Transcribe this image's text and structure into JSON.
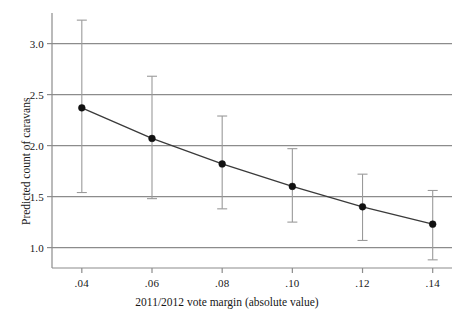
{
  "chart_data": {
    "type": "line",
    "title": "",
    "subtitle": "",
    "xlabel": "2011/2012 vote margin (absolute value)",
    "ylabel": "Predicted count of caravans",
    "x": [
      0.04,
      0.06,
      0.08,
      0.1,
      0.12,
      0.14
    ],
    "values": [
      2.37,
      2.07,
      1.82,
      1.6,
      1.4,
      1.23
    ],
    "error_low": [
      1.54,
      1.48,
      1.38,
      1.25,
      1.07,
      0.88
    ],
    "error_high": [
      3.23,
      2.68,
      2.29,
      1.97,
      1.72,
      1.56
    ],
    "series": [
      {
        "name": "Predicted count of caravans",
        "values": [
          2.37,
          2.07,
          1.82,
          1.6,
          1.4,
          1.23
        ]
      }
    ],
    "xlim": [
      0.0315,
      0.1455
    ],
    "ylim": [
      0.8,
      3.3
    ],
    "xticks": [
      0.04,
      0.06,
      0.08,
      0.1,
      0.12,
      0.14
    ],
    "xtick_labels": [
      ".04",
      ".06",
      ".08",
      ".10",
      ".12",
      ".14"
    ],
    "yticks": [
      1.0,
      1.5,
      2.0,
      2.5,
      3.0
    ],
    "ytick_labels": [
      "1.0",
      "1.5",
      "2.0",
      "2.5",
      "3.0"
    ],
    "grid": "horizontal",
    "legend": "none",
    "marker": "filled-circle",
    "errorbar_style": "vertical-capped",
    "colors": {
      "line": "#3a3a3a",
      "marker": "#111111",
      "grid": "#8c8c8c",
      "axis": "#8c8c8c",
      "errorbar": "#9a9a9a",
      "background": "#ffffff"
    }
  },
  "axes": {
    "x_title": "2011/2012 vote margin (absolute value)",
    "y_title": "Predicted count of caravans",
    "xtick_labels": [
      ".04",
      ".06",
      ".08",
      ".10",
      ".12",
      ".14"
    ],
    "ytick_labels": [
      "3.0",
      "2.5",
      "2.0",
      "1.5",
      "1.0"
    ]
  }
}
